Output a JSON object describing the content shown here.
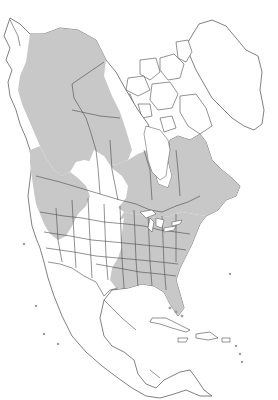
{
  "map": {
    "title": "",
    "region": "North America",
    "map_type": "species range map",
    "colors": {
      "background": "#ffffff",
      "land": "#ffffff",
      "range_fill": "#c8c8c8",
      "outline": "#4a4a4a"
    },
    "legend": [],
    "labels": [],
    "visible_regions": [
      "Alaska",
      "Canada",
      "Greenland",
      "Contiguous United States",
      "Mexico",
      "Central America",
      "Caribbean"
    ],
    "range_description": "Grey shading covers central and southern Alaska, western and central Canada, Quebec and the Maritimes, the Pacific Northwest, the northern Rockies, and most of the eastern United States south to Texas and Florida; unshaded areas include the Arctic archipelago, Greenland, the southwestern US, the Great Plains interior, Mexico and Central America."
  }
}
